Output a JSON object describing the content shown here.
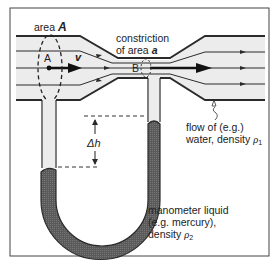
{
  "figure": {
    "labels": {
      "area_A_prefix": "area",
      "area_A_symbol": "A",
      "point_A": "A",
      "velocity": "v",
      "point_B": "B",
      "constriction_line1": "constriction",
      "constriction_line2_prefix": "of area",
      "constriction_line2_symbol": "a",
      "delta_h": "Δh",
      "flow_line1": "flow of (e.g.)",
      "flow_line2_prefix": "water, density",
      "flow_density_symbol": "ρ",
      "flow_density_sub": "1",
      "manometer_line1": "manometer liquid",
      "manometer_line2": "(e.g. mercury),",
      "manometer_line3_prefix": "density",
      "manometer_density_symbol": "ρ",
      "manometer_density_sub": "2"
    },
    "colors": {
      "line": "#2a2a2a",
      "pipe_fill": "#e9e9e9",
      "mercury": "#555555",
      "frame": "#444444"
    }
  }
}
